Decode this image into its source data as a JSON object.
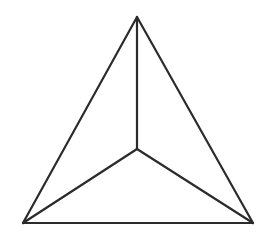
{
  "diagram": {
    "type": "tetrahedron-top-view",
    "canvas": {
      "width": 264,
      "height": 250
    },
    "stroke_color": "#2b2b2b",
    "stroke_width": 2.2,
    "vertices": {
      "apex_top": {
        "x": 137,
        "y": 17
      },
      "center": {
        "x": 137,
        "y": 149
      },
      "bottom_left": {
        "x": 23,
        "y": 223
      },
      "bottom_right": {
        "x": 253,
        "y": 223
      }
    },
    "edges": [
      {
        "name": "edge-top-to-bottom-left",
        "from": "apex_top",
        "to": "bottom_left"
      },
      {
        "name": "edge-top-to-bottom-right",
        "from": "apex_top",
        "to": "bottom_right"
      },
      {
        "name": "edge-bottom-base",
        "from": "bottom_left",
        "to": "bottom_right"
      },
      {
        "name": "edge-top-to-center",
        "from": "apex_top",
        "to": "center"
      },
      {
        "name": "edge-center-to-bottom-left",
        "from": "center",
        "to": "bottom_left"
      },
      {
        "name": "edge-center-to-bottom-right",
        "from": "center",
        "to": "bottom_right"
      }
    ]
  }
}
